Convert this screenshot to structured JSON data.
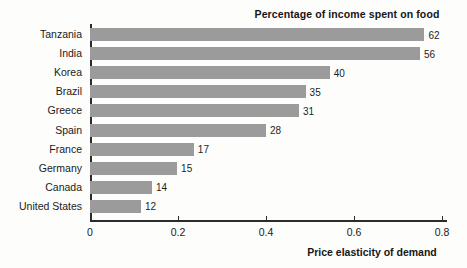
{
  "chart_data": {
    "type": "bar",
    "orientation": "horizontal",
    "title": "Percentage of income spent on food",
    "xlabel": "Price elasticity of demand",
    "ylabel": "",
    "categories": [
      "Tanzania",
      "India",
      "Korea",
      "Brazil",
      "Greece",
      "Spain",
      "France",
      "Germany",
      "Canada",
      "United States"
    ],
    "values": [
      0.76,
      0.75,
      0.545,
      0.49,
      0.475,
      0.4,
      0.236,
      0.198,
      0.141,
      0.116
    ],
    "data_labels": [
      "62",
      "56",
      "40",
      "35",
      "31",
      "28",
      "17",
      "15",
      "14",
      "12"
    ],
    "data_label_meaning": "Percentage of income spent on food",
    "xlim": [
      0,
      0.81
    ],
    "xticks": [
      0,
      0.2,
      0.4,
      0.6,
      0.8
    ],
    "xtick_labels": [
      "0",
      "0.2",
      "0.4",
      "0.6",
      "0.8"
    ],
    "grid": false,
    "legend": "none",
    "bar_color": "#9b9b9b",
    "axis_color": "#2b2b2b",
    "text_color": "#1a1a1a"
  },
  "bars": [
    {
      "category": "Tanzania",
      "elasticity": 0.76,
      "label": "62"
    },
    {
      "category": "India",
      "elasticity": 0.75,
      "label": "56"
    },
    {
      "category": "Korea",
      "elasticity": 0.545,
      "label": "40"
    },
    {
      "category": "Brazil",
      "elasticity": 0.49,
      "label": "35"
    },
    {
      "category": "Greece",
      "elasticity": 0.475,
      "label": "31"
    },
    {
      "category": "Spain",
      "elasticity": 0.4,
      "label": "28"
    },
    {
      "category": "France",
      "elasticity": 0.236,
      "label": "17"
    },
    {
      "category": "Germany",
      "elasticity": 0.198,
      "label": "15"
    },
    {
      "category": "Canada",
      "elasticity": 0.141,
      "label": "14"
    },
    {
      "category": "United States",
      "elasticity": 0.116,
      "label": "12"
    }
  ],
  "xticks": [
    {
      "value": 0,
      "label": "0"
    },
    {
      "value": 0.2,
      "label": "0.2"
    },
    {
      "value": 0.4,
      "label": "0.4"
    },
    {
      "value": 0.6,
      "label": "0.6"
    },
    {
      "value": 0.8,
      "label": "0.8"
    }
  ]
}
